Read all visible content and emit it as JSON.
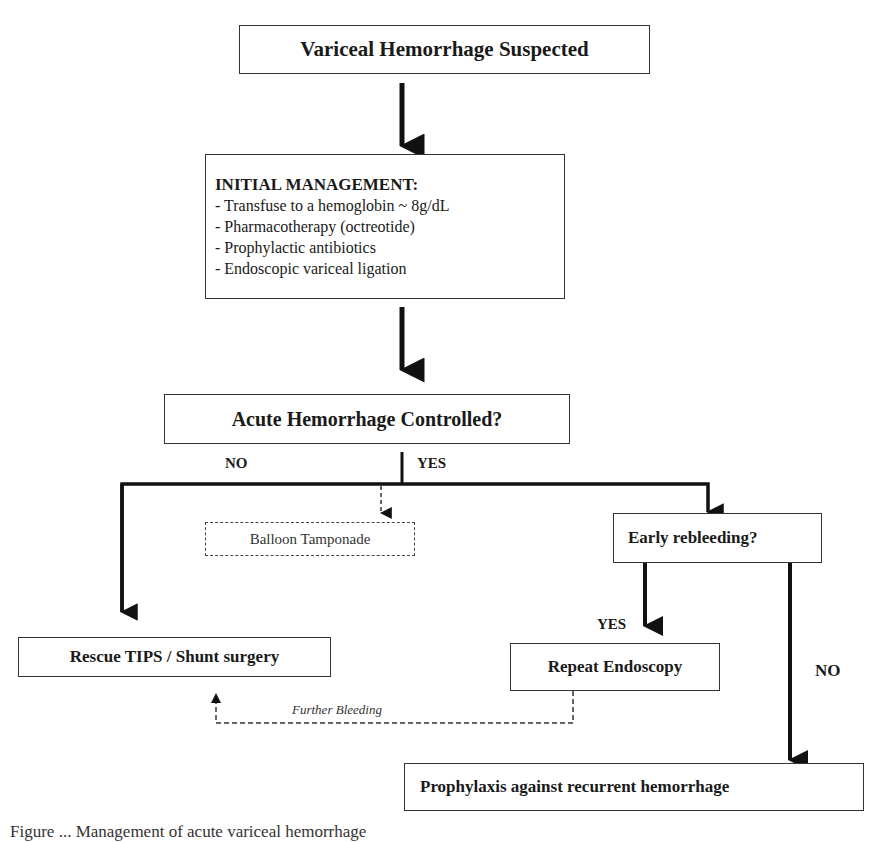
{
  "flowchart": {
    "start": {
      "label": "Variceal Hemorrhage Suspected"
    },
    "initial_management": {
      "title": "INITIAL MANAGEMENT:",
      "items": [
        "- Transfuse to a hemoglobin ~ 8g/dL",
        "-  Pharmacotherapy (octreotide)",
        "-  Prophylactic antibiotics",
        "-  Endoscopic variceal ligation"
      ]
    },
    "decision_controlled": {
      "label": "Acute Hemorrhage Controlled?"
    },
    "branch_labels": {
      "no": "NO",
      "yes": "YES",
      "rebleed_yes": "YES",
      "rebleed_no": "NO"
    },
    "balloon": {
      "label": "Balloon Tamponade"
    },
    "rescue": {
      "label": "Rescue TIPS / Shunt surgery"
    },
    "decision_rebleeding": {
      "label": "Early rebleeding?"
    },
    "repeat_endoscopy": {
      "label": "Repeat Endoscopy"
    },
    "further_bleeding": {
      "label": "Further Bleeding"
    },
    "prophylaxis": {
      "label": "Prophylaxis against recurrent hemorrhage"
    }
  },
  "caption": "Figure ... Management of acute variceal hemorrhage",
  "colors": {
    "line": "#111111",
    "border": "#333333",
    "background": "#ffffff"
  }
}
